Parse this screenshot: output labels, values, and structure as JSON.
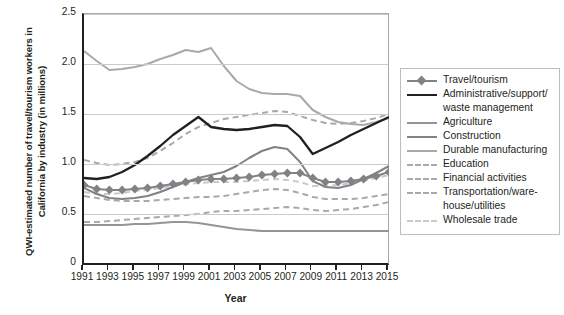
{
  "chart_data": {
    "type": "line",
    "title": "",
    "xlabel": "Year",
    "ylabel": "QWI-estimated number of travel/tourism workers in California by industry (in millions)",
    "x": [
      1991,
      1992,
      1993,
      1994,
      1995,
      1996,
      1997,
      1998,
      1999,
      2000,
      2001,
      2002,
      2003,
      2004,
      2005,
      2006,
      2007,
      2008,
      2009,
      2010,
      2011,
      2012,
      2013,
      2014,
      2015
    ],
    "xlim": [
      1991,
      2015
    ],
    "ylim": [
      0,
      2.5
    ],
    "yticks": [
      "0",
      "0.5",
      "1.0",
      "1.5",
      "2.0",
      "2.5"
    ],
    "xticks": [
      "1991",
      "1993",
      "1995",
      "1997",
      "1999",
      "2001",
      "2003",
      "2005",
      "2007",
      "2009",
      "2011",
      "2013",
      "2015"
    ],
    "grid": true,
    "legend_position": "right",
    "series": [
      {
        "name": "Travel/tourism",
        "color": "#808285",
        "style": "solid-marker",
        "values": [
          0.79,
          0.75,
          0.74,
          0.74,
          0.75,
          0.76,
          0.78,
          0.8,
          0.82,
          0.84,
          0.85,
          0.85,
          0.86,
          0.87,
          0.89,
          0.9,
          0.91,
          0.91,
          0.86,
          0.82,
          0.82,
          0.83,
          0.85,
          0.88,
          0.92
        ]
      },
      {
        "name": "Administrative/support/waste management",
        "color": "#231f20",
        "style": "solid",
        "values": [
          0.86,
          0.85,
          0.87,
          0.92,
          0.99,
          1.08,
          1.18,
          1.29,
          1.38,
          1.47,
          1.37,
          1.35,
          1.34,
          1.35,
          1.37,
          1.39,
          1.38,
          1.27,
          1.1,
          1.16,
          1.22,
          1.29,
          1.35,
          1.41,
          1.47
        ]
      },
      {
        "name": "Agriculture",
        "color": "#939598",
        "style": "solid",
        "values": [
          0.39,
          0.39,
          0.39,
          0.39,
          0.4,
          0.4,
          0.41,
          0.42,
          0.42,
          0.41,
          0.39,
          0.37,
          0.35,
          0.34,
          0.33,
          0.33,
          0.33,
          0.33,
          0.33,
          0.33,
          0.33,
          0.33,
          0.33,
          0.33,
          0.33
        ]
      },
      {
        "name": "Construction",
        "color": "#808285",
        "style": "solid",
        "values": [
          0.76,
          0.7,
          0.66,
          0.65,
          0.66,
          0.68,
          0.72,
          0.77,
          0.82,
          0.86,
          0.89,
          0.92,
          0.98,
          1.06,
          1.13,
          1.17,
          1.15,
          1.02,
          0.83,
          0.77,
          0.76,
          0.79,
          0.85,
          0.91,
          0.98
        ]
      },
      {
        "name": "Durable manufacturing",
        "color": "#a7a9ac",
        "style": "solid",
        "values": [
          2.13,
          2.03,
          1.94,
          1.95,
          1.97,
          2.0,
          2.05,
          2.09,
          2.14,
          2.12,
          2.16,
          1.98,
          1.83,
          1.75,
          1.71,
          1.7,
          1.7,
          1.68,
          1.54,
          1.47,
          1.42,
          1.4,
          1.39,
          1.42,
          1.46
        ]
      },
      {
        "name": "Education",
        "color": "#a7a9ac",
        "style": "dashed",
        "values": [
          1.04,
          1.01,
          0.99,
          1.0,
          1.02,
          1.06,
          1.13,
          1.21,
          1.3,
          1.37,
          1.41,
          1.45,
          1.47,
          1.49,
          1.51,
          1.53,
          1.52,
          1.48,
          1.44,
          1.41,
          1.4,
          1.41,
          1.43,
          1.46,
          1.5
        ]
      },
      {
        "name": "Financial activities",
        "color": "#a7a9ac",
        "style": "dashed",
        "values": [
          0.68,
          0.66,
          0.64,
          0.63,
          0.63,
          0.63,
          0.64,
          0.65,
          0.66,
          0.67,
          0.67,
          0.68,
          0.7,
          0.72,
          0.74,
          0.75,
          0.74,
          0.71,
          0.67,
          0.65,
          0.65,
          0.65,
          0.66,
          0.68,
          0.7
        ]
      },
      {
        "name": "Transportation/warehouse/utilities",
        "color": "#a7a9ac",
        "style": "dashed",
        "values": [
          0.42,
          0.42,
          0.43,
          0.44,
          0.45,
          0.46,
          0.47,
          0.48,
          0.49,
          0.5,
          0.52,
          0.53,
          0.53,
          0.54,
          0.55,
          0.56,
          0.57,
          0.56,
          0.54,
          0.53,
          0.54,
          0.55,
          0.57,
          0.59,
          0.62
        ]
      },
      {
        "name": "Wholesale trade",
        "color": "#c7c9cb",
        "style": "dashed",
        "values": [
          0.72,
          0.7,
          0.7,
          0.71,
          0.73,
          0.74,
          0.76,
          0.78,
          0.8,
          0.81,
          0.82,
          0.82,
          0.82,
          0.83,
          0.84,
          0.85,
          0.84,
          0.82,
          0.78,
          0.78,
          0.79,
          0.81,
          0.83,
          0.86,
          0.89
        ]
      }
    ]
  },
  "legend": {
    "items": [
      {
        "label": "Travel/tourism"
      },
      {
        "label": "Administrative/support/"
      },
      {
        "label": "waste management"
      },
      {
        "label": "Agriculture"
      },
      {
        "label": "Construction"
      },
      {
        "label": "Durable manufacturing"
      },
      {
        "label": "Education"
      },
      {
        "label": "Financial activities"
      },
      {
        "label": "Transportation/ware-"
      },
      {
        "label": "house/utilities"
      },
      {
        "label": "Wholesale trade"
      }
    ]
  },
  "axes": {
    "ylabel": "QWI-estimated number of travel/tourism workers in California by industry (in millions)",
    "xlabel": "Year"
  }
}
